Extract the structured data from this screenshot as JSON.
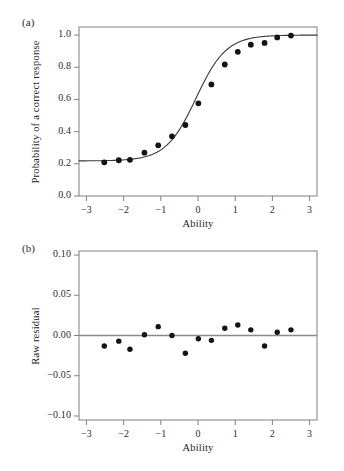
{
  "figure": {
    "panels": [
      {
        "id": "a",
        "label": "(a)",
        "ylabel": "Probability of a correct response",
        "xlabel": "Ability"
      },
      {
        "id": "b",
        "label": "(b)",
        "ylabel": "Raw residual",
        "xlabel": "Ability"
      }
    ]
  },
  "chart_data": [
    {
      "type": "scatter",
      "panel": "a",
      "title": "",
      "xlabel": "Ability",
      "ylabel": "Probability of a correct response",
      "xlim": [
        -3.2,
        3.2
      ],
      "ylim": [
        0.0,
        1.05
      ],
      "xticks": [
        -3,
        -2,
        -1,
        0,
        1,
        2,
        3
      ],
      "xtick_labels": [
        "−3",
        "−2",
        "−1",
        "0",
        "1",
        "2",
        "3"
      ],
      "yticks": [
        0.0,
        0.2,
        0.4,
        0.6,
        0.8,
        1.0
      ],
      "ytick_labels": [
        "0.0",
        "0.2",
        "0.4",
        "0.6",
        "0.8",
        "1.0"
      ],
      "grid": false,
      "legend": "none",
      "series": [
        {
          "name": "Observed proportion correct",
          "type": "scatter",
          "marker": "filled-circle",
          "color": "#141414",
          "x": [
            -2.52,
            -2.13,
            -1.83,
            -1.44,
            -1.07,
            -0.7,
            -0.34,
            0.01,
            0.36,
            0.72,
            1.07,
            1.42,
            1.79,
            2.13,
            2.5
          ],
          "y": [
            0.209,
            0.222,
            0.225,
            0.269,
            0.315,
            0.371,
            0.441,
            0.576,
            0.693,
            0.817,
            0.896,
            0.94,
            0.951,
            0.985,
            0.997
          ]
        },
        {
          "name": "Fitted item characteristic curve (3PL)",
          "type": "line",
          "color": "#3a3a3a",
          "lower_asymptote": 0.218,
          "upper_asymptote": 1.0,
          "discrimination": 1.45,
          "difficulty": -0.05,
          "x": [
            -3.0,
            -2.7,
            -2.4,
            -2.1,
            -1.8,
            -1.5,
            -1.2,
            -0.9,
            -0.6,
            -0.3,
            0.0,
            0.3,
            0.6,
            0.9,
            1.2,
            1.5,
            1.8,
            2.1,
            2.4,
            2.7,
            3.0
          ],
          "y": [
            0.221,
            0.223,
            0.226,
            0.231,
            0.238,
            0.248,
            0.263,
            0.285,
            0.317,
            0.363,
            0.425,
            0.503,
            0.591,
            0.681,
            0.762,
            0.828,
            0.879,
            0.915,
            0.941,
            0.959,
            0.971
          ]
        }
      ]
    },
    {
      "type": "scatter",
      "panel": "b",
      "title": "",
      "xlabel": "Ability",
      "ylabel": "Raw residual",
      "xlim": [
        -3.2,
        3.2
      ],
      "ylim": [
        -0.105,
        0.105
      ],
      "xticks": [
        -3,
        -2,
        -1,
        0,
        1,
        2,
        3
      ],
      "xtick_labels": [
        "−3",
        "−2",
        "−1",
        "0",
        "1",
        "2",
        "3"
      ],
      "yticks": [
        -0.1,
        -0.05,
        0.0,
        0.05,
        0.1
      ],
      "ytick_labels": [
        "−0.10",
        "−0.05",
        "0.00",
        "0.05",
        "0.10"
      ],
      "grid": false,
      "legend": "none",
      "reference_line": {
        "y": 0.0,
        "color": "#8a8a8a"
      },
      "series": [
        {
          "name": "Raw residual",
          "type": "scatter",
          "marker": "filled-circle",
          "color": "#141414",
          "x": [
            -2.52,
            -2.13,
            -1.83,
            -1.44,
            -1.07,
            -0.7,
            -0.34,
            0.01,
            0.36,
            0.72,
            1.07,
            1.42,
            1.79,
            2.13,
            2.5
          ],
          "y": [
            -0.013,
            -0.007,
            -0.017,
            0.001,
            0.011,
            0.0,
            -0.022,
            -0.004,
            -0.006,
            0.009,
            0.013,
            0.007,
            -0.013,
            0.004,
            0.007
          ]
        }
      ]
    }
  ]
}
